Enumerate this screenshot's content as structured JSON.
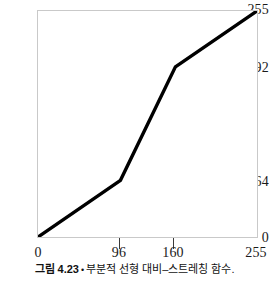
{
  "chart_data": {
    "type": "line",
    "title": "",
    "xlabel": "",
    "ylabel": "",
    "xlim": [
      0,
      255
    ],
    "ylim": [
      0,
      255
    ],
    "grid": false,
    "legend": "none",
    "xticks": [
      0,
      96,
      160,
      255
    ],
    "xtick_labels": [
      "0",
      "96",
      "160",
      "255"
    ],
    "yticks": [
      0,
      64,
      192,
      255
    ],
    "ytick_labels": [
      "0",
      "64",
      "192",
      "255"
    ],
    "series": [
      {
        "name": "piecewise-linear contrast stretching transform",
        "color": "#000000",
        "linewidth": 3,
        "x": [
          0,
          96,
          160,
          255
        ],
        "y": [
          0,
          64,
          192,
          255
        ],
        "points": [
          {
            "x": 0,
            "y": 0
          },
          {
            "x": 96,
            "y": 64
          },
          {
            "x": 160,
            "y": 192
          },
          {
            "x": 255,
            "y": 255
          }
        ]
      }
    ]
  },
  "caption": {
    "figure_number": "그림 4.23",
    "bullet": "•",
    "text": "부분적 선형 대비–스트레칭 함수."
  },
  "colors": {
    "curve": "#000000",
    "frame": "#c9c9c9",
    "tick": "#3a3a3a",
    "text": "#1a1a1a",
    "background": "#ffffff"
  }
}
